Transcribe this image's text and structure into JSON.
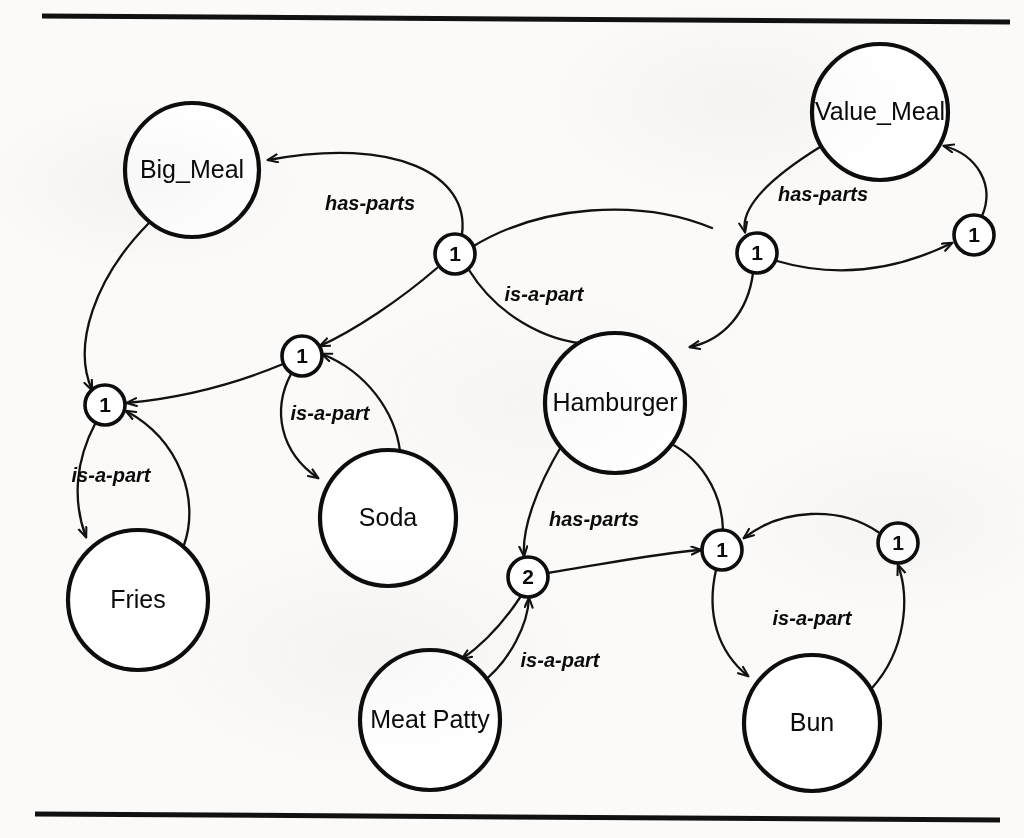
{
  "figure": {
    "type": "node-and-port graph",
    "background_color": "#fbfaf8",
    "ink_color": "#111111",
    "rules": [
      {
        "name": "top-rule",
        "x1": 42,
        "y1": 16,
        "x2": 1010,
        "y2": 22
      },
      {
        "name": "bottom-rule",
        "x1": 35,
        "y1": 814,
        "x2": 1000,
        "y2": 820
      }
    ]
  },
  "nodes": [
    {
      "id": "big_meal",
      "label": "Big_Meal",
      "cx": 192,
      "cy": 170,
      "r": 67
    },
    {
      "id": "value_meal",
      "label": "Value_Meal",
      "cx": 880,
      "cy": 112,
      "r": 68
    },
    {
      "id": "hamburger",
      "label": "Hamburger",
      "cx": 615,
      "cy": 403,
      "r": 70
    },
    {
      "id": "soda",
      "label": "Soda",
      "cx": 388,
      "cy": 518,
      "r": 68
    },
    {
      "id": "fries",
      "label": "Fries",
      "cx": 138,
      "cy": 600,
      "r": 70
    },
    {
      "id": "meat_patty",
      "label": "Meat Patty",
      "cx": 430,
      "cy": 720,
      "r": 70
    },
    {
      "id": "bun",
      "label": "Bun",
      "cx": 812,
      "cy": 723,
      "r": 68
    }
  ],
  "ports": [
    {
      "id": "p_bm_fries",
      "label": "1",
      "cx": 105,
      "cy": 405,
      "r": 20
    },
    {
      "id": "p_bm_soda",
      "label": "1",
      "cx": 302,
      "cy": 356,
      "r": 20
    },
    {
      "id": "p_bm_hamb",
      "label": "1",
      "cx": 455,
      "cy": 254,
      "r": 20
    },
    {
      "id": "p_vm_hamb",
      "label": "1",
      "cx": 757,
      "cy": 253,
      "r": 20
    },
    {
      "id": "p_vm_right",
      "label": "1",
      "cx": 974,
      "cy": 235,
      "r": 20
    },
    {
      "id": "p_hb_patty",
      "label": "2",
      "cx": 528,
      "cy": 577,
      "r": 20
    },
    {
      "id": "p_hb_bun",
      "label": "1",
      "cx": 722,
      "cy": 550,
      "r": 20
    },
    {
      "id": "p_bun_right",
      "label": "1",
      "cx": 898,
      "cy": 543,
      "r": 20
    }
  ],
  "edge_labels": [
    {
      "id": "lbl_bm_hasparts",
      "text": "has-parts",
      "x": 370,
      "y": 205
    },
    {
      "id": "lbl_vm_hasparts",
      "text": "has-parts",
      "x": 823,
      "y": 196
    },
    {
      "id": "lbl_hamb_isapart",
      "text": "is-a-part",
      "x": 544,
      "y": 296
    },
    {
      "id": "lbl_soda_isapart",
      "text": "is-a-part",
      "x": 330,
      "y": 415
    },
    {
      "id": "lbl_fries_isapart",
      "text": "is-a-part",
      "x": 111,
      "y": 477
    },
    {
      "id": "lbl_hb_hasparts",
      "text": "has-parts",
      "x": 594,
      "y": 521
    },
    {
      "id": "lbl_patty_isapart",
      "text": "is-a-part",
      "x": 560,
      "y": 662
    },
    {
      "id": "lbl_bun_isapart",
      "text": "is-a-part",
      "x": 812,
      "y": 620
    }
  ],
  "edges": [
    {
      "id": "e_bm_to_hamb_port",
      "from": "big_meal",
      "to": "p_bm_hamb",
      "relation": "has-parts",
      "arrow_at": "big_meal"
    },
    {
      "id": "e_bm_to_fries_port",
      "from": "big_meal",
      "to": "p_bm_fries",
      "relation": "has-parts",
      "arrow_at": "p_bm_fries"
    },
    {
      "id": "e_soda_port_to_bm",
      "from": "p_bm_soda",
      "to": "p_bm_fries",
      "relation": "has-parts",
      "arrow_at": "p_bm_fries"
    },
    {
      "id": "e_hamb_port_chain",
      "from": "p_bm_hamb",
      "to": "p_bm_soda",
      "relation": "has-parts",
      "arrow_at": "p_bm_soda"
    },
    {
      "id": "e_hamb_isapart",
      "from": "hamburger",
      "to": "p_bm_hamb",
      "relation": "is-a-part",
      "arrow_at": "hamburger"
    },
    {
      "id": "e_vm_to_port",
      "from": "value_meal",
      "to": "p_vm_hamb",
      "relation": "has-parts",
      "arrow_at": "p_vm_hamb"
    },
    {
      "id": "e_vm_port_right",
      "from": "p_vm_hamb",
      "to": "p_vm_right",
      "relation": "has-parts",
      "arrow_at": "p_vm_right"
    },
    {
      "id": "e_vm_right_back",
      "from": "p_vm_right",
      "to": "value_meal",
      "relation": "has-parts",
      "arrow_at": "value_meal"
    },
    {
      "id": "e_vm_port_to_hamb",
      "from": "p_vm_hamb",
      "to": "hamburger",
      "relation": "has-parts",
      "arrow_at": "hamburger"
    },
    {
      "id": "e_fries_isapart",
      "from": "p_bm_fries",
      "to": "fries",
      "relation": "is-a-part",
      "arrow_at": "fries"
    },
    {
      "id": "e_fries_back",
      "from": "fries",
      "to": "p_bm_fries",
      "relation": "is-a-part",
      "arrow_at": "p_bm_fries"
    },
    {
      "id": "e_soda_isapart",
      "from": "p_bm_soda",
      "to": "soda",
      "relation": "is-a-part",
      "arrow_at": "soda"
    },
    {
      "id": "e_soda_back",
      "from": "soda",
      "to": "p_bm_soda",
      "relation": "is-a-part",
      "arrow_at": "p_bm_soda"
    },
    {
      "id": "e_hb_to_patty_port",
      "from": "hamburger",
      "to": "p_hb_patty",
      "relation": "has-parts",
      "arrow_at": "p_hb_patty"
    },
    {
      "id": "e_hb_to_bun_port",
      "from": "p_hb_patty",
      "to": "p_hb_bun",
      "relation": "has-parts",
      "arrow_at": "p_hb_bun"
    },
    {
      "id": "e_bun_port_to_hb",
      "from": "p_hb_bun",
      "to": "hamburger",
      "relation": "has-parts",
      "arrow_at": "hamburger"
    },
    {
      "id": "e_patty_isapart",
      "from": "p_hb_patty",
      "to": "meat_patty",
      "relation": "is-a-part",
      "arrow_at": "meat_patty"
    },
    {
      "id": "e_patty_back",
      "from": "meat_patty",
      "to": "p_hb_patty",
      "relation": "is-a-part",
      "arrow_at": "p_hb_patty"
    },
    {
      "id": "e_bun_isapart",
      "from": "p_hb_bun",
      "to": "bun",
      "relation": "is-a-part",
      "arrow_at": "bun"
    },
    {
      "id": "e_bun_back",
      "from": "bun",
      "to": "p_bun_right",
      "relation": "is-a-part",
      "arrow_at": "p_bun_right"
    },
    {
      "id": "e_bun_right_to_hb",
      "from": "p_bun_right",
      "to": "p_hb_bun",
      "relation": "is-a-part",
      "arrow_at": "p_hb_bun"
    }
  ]
}
